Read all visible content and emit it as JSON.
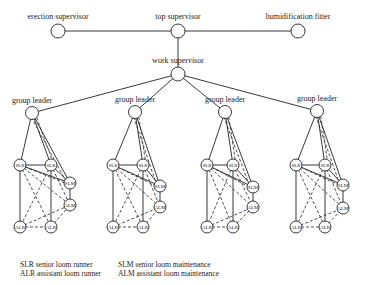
{
  "top": {
    "erection": {
      "label": "erection supervisor",
      "x": 58,
      "y": 31
    },
    "top": {
      "label": "top supervisor",
      "x": 178,
      "y": 31
    },
    "humid": {
      "label": "humidification fitter",
      "x": 298,
      "y": 31
    },
    "work": {
      "label": "work supervisor",
      "x": 178,
      "y": 74
    }
  },
  "group_label": "group leader",
  "node_labels": {
    "slr": "SLR",
    "slm": "SLM",
    "alm": "ALM",
    "alr": "ALR"
  },
  "groups": [
    {
      "gl": [
        32,
        113
      ],
      "slr1": [
        20,
        165
      ],
      "slr2": [
        51,
        165
      ],
      "slm": [
        70,
        183
      ],
      "alm": [
        70,
        205
      ],
      "alr1": [
        20,
        227
      ],
      "alr2": [
        51,
        227
      ]
    },
    {
      "gl": [
        135,
        112
      ],
      "slr1": [
        113,
        165
      ],
      "slr2": [
        143,
        165
      ],
      "slm": [
        160,
        186
      ],
      "alm": [
        160,
        207
      ],
      "alr1": [
        113,
        227
      ],
      "alr2": [
        143,
        227
      ]
    },
    {
      "gl": [
        225,
        112
      ],
      "slr1": [
        207,
        165
      ],
      "slr2": [
        233,
        165
      ],
      "slm": [
        253,
        187
      ],
      "alm": [
        253,
        207
      ],
      "alr1": [
        207,
        227
      ],
      "alr2": [
        233,
        227
      ]
    },
    {
      "gl": [
        317,
        111
      ],
      "slr1": [
        296,
        165
      ],
      "slr2": [
        325,
        165
      ],
      "slm": [
        343,
        185
      ],
      "alm": [
        343,
        208
      ],
      "alr1": [
        296,
        227
      ],
      "alr2": [
        325,
        227
      ]
    }
  ],
  "legend": {
    "slr": "SLR senior loom runner",
    "alr": "ALR assistant loom runner",
    "slm": "SLM senior loom maintenance",
    "alm": "ALM assistant loom maintenance"
  }
}
